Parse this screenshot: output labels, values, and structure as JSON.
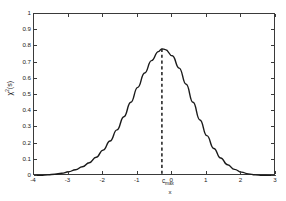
{
  "chart_data": {
    "type": "line",
    "title": "",
    "xlabel": "x",
    "ylabel_main": "χ",
    "ylabel_sup": "2",
    "ylabel_arg": "(s)",
    "ylabel": "χ²(s)",
    "xlim": [
      -4,
      3
    ],
    "ylim": [
      0,
      1
    ],
    "grid": false,
    "legend": null,
    "xticks": [
      -4,
      -3,
      -2,
      -1,
      0,
      1,
      2,
      3
    ],
    "xticklabels": [
      "-4",
      "-3",
      "-2",
      "-1",
      "0",
      "1",
      "2",
      "3"
    ],
    "yticks": [
      0,
      0.1,
      0.2,
      0.3,
      0.4,
      0.5,
      0.6,
      0.7,
      0.8,
      0.9,
      1
    ],
    "yticklabels": [
      "0",
      "0.1",
      "0.2",
      "0.3",
      "0.4",
      "0.5",
      "0.6",
      "0.7",
      "0.8",
      "0.9",
      "1"
    ],
    "line_color": "#1a1a1a",
    "line_width": 1.4,
    "annotations": [
      {
        "name": "c-max-marker",
        "type": "vertical-dashed-line",
        "x": -0.3,
        "label_main": "c",
        "label_sub": "max",
        "label": "c_max",
        "color": "#1a1a1a"
      }
    ],
    "peak": {
      "x": -0.3,
      "y": 0.785
    },
    "series": [
      {
        "name": "chi2",
        "x": [
          -4.0,
          -3.8,
          -3.6,
          -3.4,
          -3.2,
          -3.0,
          -2.8,
          -2.6,
          -2.4,
          -2.2,
          -2.0,
          -1.8,
          -1.6,
          -1.4,
          -1.2,
          -1.0,
          -0.8,
          -0.6,
          -0.4,
          -0.3,
          -0.2,
          0.0,
          0.2,
          0.4,
          0.6,
          0.8,
          1.0,
          1.2,
          1.4,
          1.6,
          1.8,
          2.0,
          2.2,
          2.4,
          2.6,
          2.8,
          3.0
        ],
        "values": [
          0.002,
          0.004,
          0.007,
          0.011,
          0.017,
          0.026,
          0.039,
          0.057,
          0.082,
          0.116,
          0.16,
          0.216,
          0.285,
          0.366,
          0.455,
          0.547,
          0.636,
          0.712,
          0.768,
          0.785,
          0.78,
          0.742,
          0.666,
          0.566,
          0.455,
          0.346,
          0.249,
          0.17,
          0.111,
          0.069,
          0.041,
          0.024,
          0.013,
          0.007,
          0.004,
          0.002,
          0.001
        ]
      }
    ]
  },
  "axes": {
    "frame_color": "#3a3a3a",
    "background": "#ffffff"
  }
}
